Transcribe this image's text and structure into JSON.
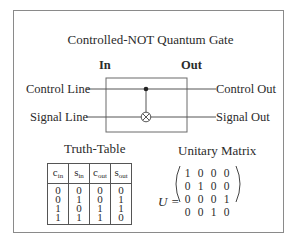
{
  "title": "Controlled-NOT Quantum Gate",
  "circuit": {
    "in_label": "In",
    "out_label": "Out",
    "inputs": [
      "Control Line",
      "Signal Line"
    ],
    "outputs": [
      "Control Out",
      "Signal Out"
    ],
    "control_symbol": "control-dot",
    "target_symbol": "xor-circle"
  },
  "truth_table": {
    "title": "Truth-Table",
    "headers": [
      {
        "base": "c",
        "sub": "in"
      },
      {
        "base": "s",
        "sub": "in"
      },
      {
        "base": "c",
        "sub": "out"
      },
      {
        "base": "s",
        "sub": "out"
      }
    ],
    "columns": [
      [
        "0",
        "0",
        "1",
        "1"
      ],
      [
        "0",
        "1",
        "0",
        "1"
      ],
      [
        "0",
        "0",
        "1",
        "1"
      ],
      [
        "0",
        "1",
        "1",
        "0"
      ]
    ]
  },
  "unitary": {
    "title": "Unitary Matrix",
    "symbol": "U =",
    "rows": [
      [
        "1",
        "0",
        "0",
        "0"
      ],
      [
        "0",
        "1",
        "0",
        "0"
      ],
      [
        "0",
        "0",
        "0",
        "1"
      ],
      [
        "0",
        "0",
        "1",
        "0"
      ]
    ]
  }
}
